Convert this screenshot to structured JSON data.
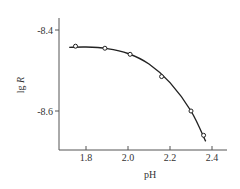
{
  "chart_data": {
    "type": "scatter",
    "title": "",
    "xlabel": "pH",
    "ylabel": "lg R",
    "ylabel_main": "lg ",
    "ylabel_italic": "R",
    "xlim": [
      1.7,
      2.47
    ],
    "ylim": [
      -8.7,
      -8.37
    ],
    "x_ticks": [
      1.8,
      2.0,
      2.2,
      2.4
    ],
    "x_tick_labels": [
      "1.8",
      "2.0",
      "2.2",
      "2.4"
    ],
    "y_ticks": [
      -8.4,
      -8.6
    ],
    "y_tick_labels": [
      "-8.4",
      "-8.6"
    ],
    "grid": false,
    "legend": null,
    "series": [
      {
        "name": "measured",
        "marker": "open-circle",
        "x": [
          1.75,
          1.89,
          2.01,
          2.16,
          2.3,
          2.36
        ],
        "y": [
          -8.44,
          -8.445,
          -8.46,
          -8.515,
          -8.6,
          -8.66
        ]
      },
      {
        "name": "fit curve",
        "style": "line",
        "x": [
          1.72,
          1.8,
          1.9,
          2.0,
          2.1,
          2.2,
          2.3,
          2.37
        ],
        "y": [
          -8.443,
          -8.442,
          -8.446,
          -8.458,
          -8.484,
          -8.53,
          -8.6,
          -8.675
        ]
      }
    ],
    "colors": {
      "axis": "#555555",
      "line": "#222222",
      "text": "#333333"
    }
  }
}
